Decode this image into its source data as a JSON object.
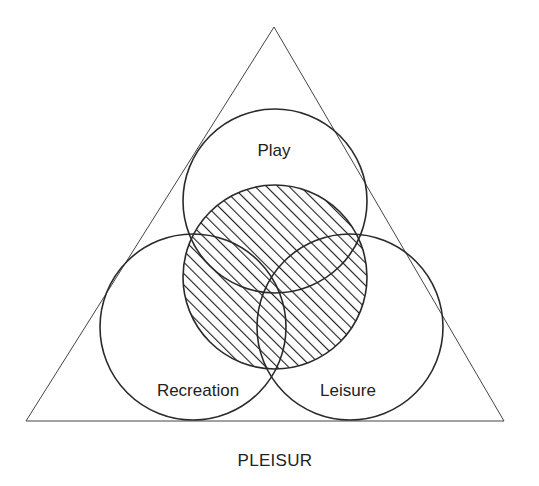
{
  "diagram": {
    "type": "venn-in-triangle",
    "title": "PLEISUR",
    "colors": {
      "stroke": "#2a2a2a",
      "triangle_stroke": "#444444",
      "text": "#222222",
      "background": "#ffffff"
    },
    "triangle": {
      "apex": [
        274,
        27
      ],
      "base_left": [
        26,
        421
      ],
      "base_right": [
        504,
        421
      ]
    },
    "circles": [
      {
        "id": "play",
        "label": "Play",
        "cx": 275,
        "cy": 201,
        "r": 92,
        "label_pos": [
          274,
          152
        ]
      },
      {
        "id": "recreation",
        "label": "Recreation",
        "cx": 193,
        "cy": 327,
        "r": 93,
        "label_pos": [
          198,
          392
        ]
      },
      {
        "id": "leisure",
        "label": "Leisure",
        "cx": 350,
        "cy": 327,
        "r": 93,
        "label_pos": [
          348,
          392
        ]
      },
      {
        "id": "pleisur-core",
        "label": "",
        "cx": 275,
        "cy": 277,
        "r": 92,
        "hatched": true
      }
    ],
    "hatch": {
      "direction": "diagonal-up-right",
      "spacing_px": 8
    },
    "labels": {
      "play": "Play",
      "recreation": "Recreation",
      "leisure": "Leisure",
      "pleisur": "PLEISUR"
    },
    "title_pos": [
      275,
      462
    ]
  }
}
